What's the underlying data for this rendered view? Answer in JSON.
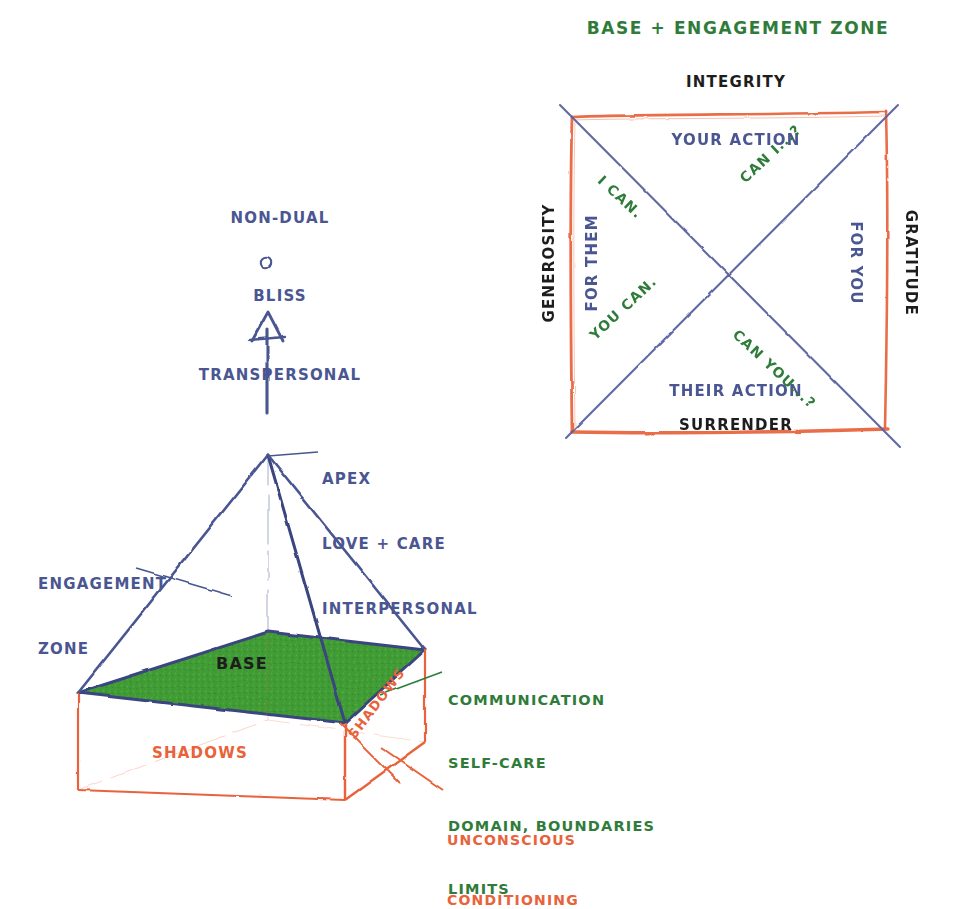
{
  "colors": {
    "blue": "#4a5691",
    "green": "#2f7c3a",
    "green_fill": "#3f9b35",
    "orange": "#e8623a",
    "black": "#1d1d1d",
    "background": "#ffffff"
  },
  "right_diagram": {
    "title": "BASE + ENGAGEMENT ZONE",
    "edges": {
      "top": "INTEGRITY",
      "bottom": "SURRENDER",
      "left": "GENEROSITY",
      "right": "GRATITUDE"
    },
    "quadrants": {
      "top": "YOUR ACTION",
      "bottom": "THEIR ACTION",
      "left": "FOR THEM",
      "right": "FOR YOU"
    },
    "diagonal_labels": {
      "upper_left": "I CAN.",
      "upper_right": "CAN I...?",
      "lower_left": "YOU CAN.",
      "lower_right": "CAN YOU...?"
    }
  },
  "pyramid": {
    "top_stack": [
      "NON-DUAL",
      "BLISS",
      "TRANSPERSONAL"
    ],
    "apex_stack": [
      "APEX",
      "LOVE + CARE",
      "INTERPERSONAL"
    ],
    "engagement_stack": [
      "ENGAGEMENT",
      "ZONE"
    ],
    "base_label": "BASE",
    "base_detail_stack": [
      "COMMUNICATION",
      "SELF-CARE",
      "DOMAIN, BOUNDARIES",
      "LIMITS"
    ],
    "shadows_front": "SHADOWS",
    "shadows_side": "SHADOWS",
    "unconscious_stack": [
      "UNCONSCIOUS",
      "CONDITIONING"
    ]
  }
}
